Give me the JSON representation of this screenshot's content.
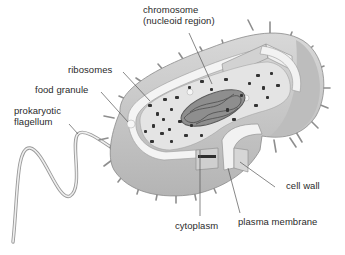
{
  "diagram": {
    "colors": {
      "background": "#ffffff",
      "capsule_outer": "#c9c9c9",
      "capsule_shadow": "#a8a8a8",
      "wall_light": "#ececec",
      "cytoplasm": "#e6e6e6",
      "ribosome": "#3a3a3a",
      "chromosome": "#6e6e6e",
      "leader_line": "#555555",
      "text": "#2a2a2a"
    },
    "labels": {
      "chromosome": "chromosome\n(nucleoid region)",
      "ribosomes": "ribosomes",
      "food_granule": "food granule",
      "flagellum": "prokaryotic\nflagellum",
      "cell_wall": "cell wall",
      "cytoplasm": "cytoplasm",
      "plasma_membrane": "plasma membrane"
    }
  }
}
